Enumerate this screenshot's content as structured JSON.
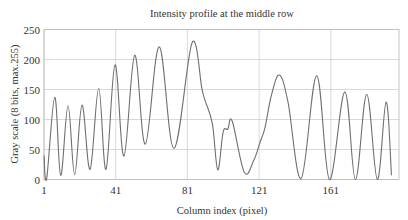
{
  "chart_data": {
    "type": "line",
    "title": "Intensity profile at the middle row",
    "xlabel": "Column index (pixel)",
    "ylabel": "Gray scale (8 bits, max.255)",
    "xlim": [
      1,
      199
    ],
    "ylim": [
      0,
      250
    ],
    "xticks": [
      1,
      41,
      81,
      121,
      161
    ],
    "yticks": [
      0,
      50,
      100,
      150,
      200,
      250
    ],
    "grid": true,
    "legend": "none",
    "series": [
      {
        "name": "Intensity profile",
        "color": "#6f6f6f",
        "x": [
          1,
          2.5,
          7,
          10.3,
          14.4,
          18.1,
          22.2,
          26.7,
          31.5,
          35.6,
          40.6,
          45.6,
          51.6,
          57.5,
          65.3,
          73.5,
          83.6,
          89.1,
          90.8,
          94.9,
          97.9,
          100.9,
          103.5,
          106,
          112.7,
          118,
          121.5,
          124.3,
          127.8,
          132.3,
          137.1,
          144.5,
          153.1,
          160.2,
          168.8,
          174.7,
          181,
          186.9,
          191.8,
          194.8
        ],
        "y": [
          40,
          2,
          137,
          7,
          123,
          8,
          124,
          17,
          152,
          17,
          191,
          39,
          207,
          59,
          221,
          52,
          228,
          151,
          132,
          93,
          16,
          79,
          84,
          97,
          12,
          32,
          62,
          87,
          140,
          174,
          129,
          2,
          173,
          0,
          146,
          0,
          142,
          0,
          129,
          7
        ]
      }
    ]
  }
}
